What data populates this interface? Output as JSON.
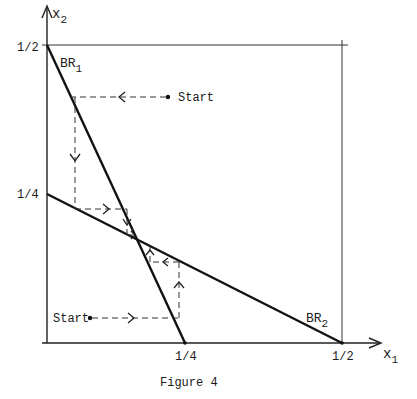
{
  "figure": {
    "caption": "Figure 4",
    "axes": {
      "x_label": "x",
      "x_sub": "1",
      "y_label": "x",
      "y_sub": "2",
      "x_ticks": [
        "1/4",
        "1/2"
      ],
      "y_ticks": [
        "1/2",
        "1/4"
      ]
    },
    "curves": [
      {
        "name": "BR",
        "sub": "1",
        "from": [
          0,
          0.5
        ],
        "to": [
          0.25,
          0
        ]
      },
      {
        "name": "BR",
        "sub": "2",
        "from": [
          0,
          0.25
        ],
        "to": [
          0.5,
          0
        ]
      }
    ],
    "start_labels": [
      "Start",
      "Start"
    ],
    "colors": {
      "ink": "#111111",
      "background": "#ffffff"
    }
  }
}
